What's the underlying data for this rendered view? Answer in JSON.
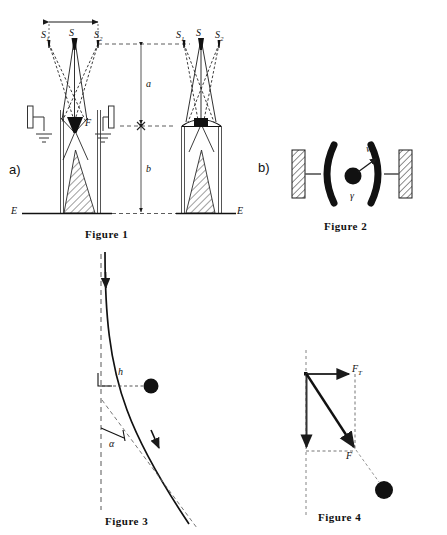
{
  "page": {
    "width": 447,
    "height": 535,
    "background": "#ffffff",
    "ink": "#111111",
    "type": "scientific-figure-plate"
  },
  "panels": [
    {
      "key": "a",
      "label": "a)",
      "contains": "Figure 1"
    },
    {
      "key": "b",
      "label": "b)",
      "contains": "Figure 2"
    }
  ],
  "captions": {
    "figure1": "Figure 1",
    "figure2": "Figure 2",
    "figure3": "Figure 3",
    "figure4": "Figure 4"
  },
  "figure1": {
    "caption": "Figure 1",
    "panel_letter": "a)",
    "left_diagram": {
      "source_labels": [
        "S",
        "S",
        "S"
      ],
      "source_sub": [
        "1",
        "",
        "2"
      ],
      "span_arrow": "double-headed horizontal arrow spanning S1 to S2",
      "focus_label": "F",
      "ground_symbols": 2,
      "baseline_label": "E",
      "hatched_cone": true
    },
    "right_diagram": {
      "source_labels": [
        "S",
        "S",
        "S"
      ],
      "source_sub": [
        "1",
        "",
        "2"
      ],
      "baseline_label": "E",
      "hatched_cone": true,
      "lens_line": true
    },
    "dimensions": [
      {
        "name": "a",
        "label": "a",
        "span": "top plane to mid plane"
      },
      {
        "name": "b",
        "label": "b",
        "span": "mid plane to baseline E"
      }
    ],
    "baseline_labels": {
      "left": "E",
      "right": "E"
    }
  },
  "figure2": {
    "caption": "Figure 2",
    "panel_letter": "b)",
    "elements": {
      "left_wall": "hatched-wall",
      "right_wall": "hatched-wall",
      "left_electrode": "curved-arc-electrode",
      "right_electrode": "curved-arc-electrode",
      "particle": "filled-circle",
      "velocity_label": "w",
      "angle_label": "γ"
    }
  },
  "figure3": {
    "caption": "Figure 3",
    "labels": {
      "offset": "h",
      "angle": "α"
    },
    "elements": {
      "trajectory": "curved-solid-line-with-two-arrowheads",
      "vertical_reference": "dashed-vertical-line",
      "tangent_asymptote": "dashed-inclined-line",
      "right_angle_marker": true,
      "particle": "filled-circle"
    }
  },
  "figure4": {
    "caption": "Figure 4",
    "labels": {
      "transverse_force": "F",
      "transverse_force_sub": "T",
      "resultant_force": "F"
    },
    "elements": {
      "vertical_reference": "dashed-vertical-line",
      "horizontal_vector": "arrow-right",
      "vertical_vector": "arrow-down",
      "resultant_vector": "arrow-diagonal-down-right",
      "dashed_projection": true,
      "particle": "filled-circle"
    }
  }
}
